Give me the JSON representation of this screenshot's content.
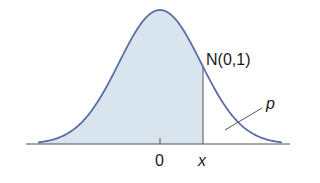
{
  "diagram": {
    "curve_label": "N(0,1)",
    "tail_label": "p",
    "axis_ticks": [
      "0",
      "x"
    ],
    "colors": {
      "curve": "#5a6ea6",
      "fill": "#d8e5ee",
      "axis": "#555555",
      "text": "#1a1a1a"
    }
  }
}
